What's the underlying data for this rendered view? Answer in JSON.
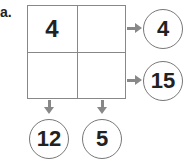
{
  "problem_label": "a.",
  "grid": {
    "cells": [
      {
        "row": 0,
        "col": 0,
        "value": "4"
      },
      {
        "row": 0,
        "col": 1,
        "value": ""
      },
      {
        "row": 1,
        "col": 0,
        "value": ""
      },
      {
        "row": 1,
        "col": 1,
        "value": ""
      }
    ]
  },
  "row_results": [
    "4",
    "15"
  ],
  "col_results": [
    "12",
    "5"
  ]
}
